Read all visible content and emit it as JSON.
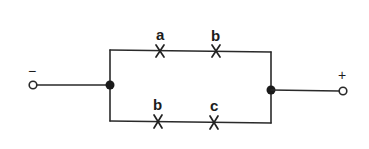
{
  "diagram": {
    "type": "parallel switching circuit",
    "terminals": {
      "negative": {
        "symbol": "−",
        "x": 33,
        "y": 85
      },
      "positive": {
        "symbol": "+",
        "x": 343,
        "y": 91
      }
    },
    "junctions": {
      "left": {
        "x": 110,
        "y": 85
      },
      "right": {
        "x": 271,
        "y": 90
      }
    },
    "branches": [
      {
        "name": "top",
        "y": 50,
        "contacts": [
          {
            "label": "a",
            "x": 160
          },
          {
            "label": "b",
            "x": 216
          }
        ]
      },
      {
        "name": "bottom",
        "y": 121,
        "contacts": [
          {
            "label": "b",
            "x": 158
          },
          {
            "label": "c",
            "x": 214
          }
        ]
      }
    ],
    "colors": {
      "line": "#2a2a2a",
      "background": "#ffffff"
    }
  }
}
